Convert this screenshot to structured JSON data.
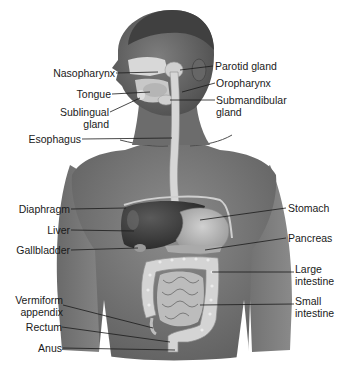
{
  "diagram": {
    "colors": {
      "skin": "#7a7a7a",
      "skin_dark": "#5a5a5a",
      "liver": "#3e3e3e",
      "stomach": "#b8b8b8",
      "intestine": "#d6d6d6",
      "gland": "#d8d8d8",
      "leader_line": "#1a1a1a"
    },
    "labels_left": [
      {
        "id": "nasopharynx",
        "text": "Nasopharynx"
      },
      {
        "id": "tongue",
        "text": "Tongue"
      },
      {
        "id": "sublingual-gland",
        "line1": "Sublingual",
        "line2": "gland"
      },
      {
        "id": "esophagus",
        "text": "Esophagus"
      },
      {
        "id": "diaphragm",
        "text": "Diaphragm"
      },
      {
        "id": "liver",
        "text": "Liver"
      },
      {
        "id": "gallbladder",
        "text": "Gallbladder"
      },
      {
        "id": "vermiform-appendix",
        "line1": "Vermiform",
        "line2": "appendix"
      },
      {
        "id": "rectum",
        "text": "Rectum"
      },
      {
        "id": "anus",
        "text": "Anus"
      }
    ],
    "labels_right": [
      {
        "id": "parotid-gland",
        "text": "Parotid gland"
      },
      {
        "id": "oropharynx",
        "text": "Oropharynx"
      },
      {
        "id": "submandibular-gland",
        "line1": "Submandibular",
        "line2": "gland"
      },
      {
        "id": "stomach",
        "text": "Stomach"
      },
      {
        "id": "pancreas",
        "text": "Pancreas"
      },
      {
        "id": "large-intestine",
        "line1": "Large",
        "line2": "intestine"
      },
      {
        "id": "small-intestine",
        "line1": "Small",
        "line2": "intestine"
      }
    ]
  }
}
